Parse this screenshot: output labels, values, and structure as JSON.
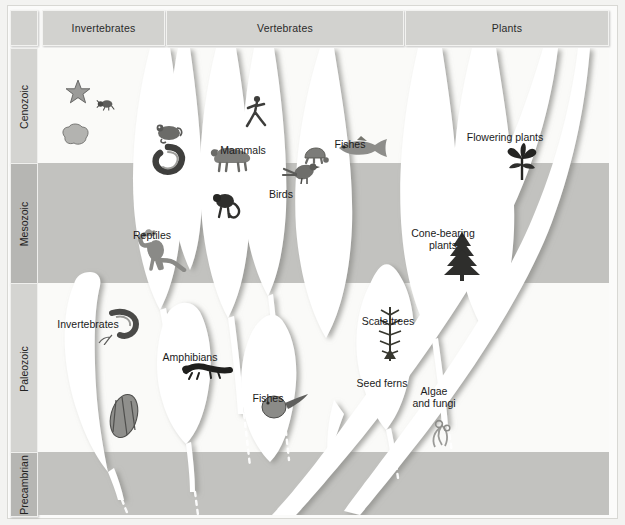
{
  "figure": {
    "kind": "evolutionary-tree-diagram",
    "columns": [
      {
        "id": "invertebrates",
        "label": "Invertebrates",
        "x": 42,
        "width": 121
      },
      {
        "id": "vertebrates",
        "label": "Vertebrates",
        "x": 166,
        "width": 236
      },
      {
        "id": "plants",
        "label": "Plants",
        "x": 405,
        "width": 202
      }
    ],
    "eras": [
      {
        "id": "cenozoic",
        "label": "Cenozoic",
        "top": 48,
        "height": 115,
        "shade": "light"
      },
      {
        "id": "mesozoic",
        "label": "Mesozoic",
        "top": 163,
        "height": 120,
        "shade": "dark"
      },
      {
        "id": "paleozoic",
        "label": "Paleozoic",
        "top": 283,
        "height": 169,
        "shade": "light"
      },
      {
        "id": "precambrian",
        "label": "Precambrian",
        "top": 452,
        "height": 63,
        "shade": "dark"
      }
    ],
    "groups": [
      {
        "id": "invertebrates-upper",
        "label": "Invertebrates",
        "x": 88,
        "y": 277,
        "lines": 1,
        "organism": "trilobite"
      },
      {
        "id": "reptiles",
        "label": "Reptiles",
        "x": 152,
        "y": 188,
        "lines": 1,
        "organism": "dinosaur"
      },
      {
        "id": "amphibians",
        "label": "Amphibians",
        "x": 190,
        "y": 310,
        "lines": 1,
        "organism": "salamander"
      },
      {
        "id": "mammals",
        "label": "Mammals",
        "x": 243,
        "y": 103,
        "lines": 1,
        "organism": "buffalo"
      },
      {
        "id": "birds",
        "label": "Birds",
        "x": 281,
        "y": 147,
        "lines": 1,
        "organism": "bird"
      },
      {
        "id": "fishes-lower",
        "label": "Fishes",
        "x": 268,
        "y": 351,
        "lines": 1,
        "organism": "jawless-fish"
      },
      {
        "id": "fishes-upper",
        "label": "Fishes",
        "x": 350,
        "y": 97,
        "lines": 1,
        "organism": "trout"
      },
      {
        "id": "scale-trees",
        "label": "Scale trees",
        "x": 388,
        "y": 274,
        "lines": 1,
        "organism": "lycopod"
      },
      {
        "id": "seed-ferns",
        "label": "Seed ferns",
        "x": 382,
        "y": 342,
        "lines": 2,
        "organism": ""
      },
      {
        "id": "algae-and-fungi",
        "label": "Algae and fungi",
        "x": 434,
        "y": 350,
        "lines": 3,
        "organism": "algae"
      },
      {
        "id": "cone-bearing-plants",
        "label": "Cone-bearing plants",
        "x": 443,
        "y": 192,
        "lines": 2,
        "organism": "conifer"
      },
      {
        "id": "flowering-plants",
        "label": "Flowering plants",
        "x": 505,
        "y": 90,
        "lines": 1,
        "organism": "iris"
      }
    ],
    "extra_organisms": [
      {
        "id": "starfish",
        "x": 78,
        "y": 92
      },
      {
        "id": "insect",
        "x": 106,
        "y": 104
      },
      {
        "id": "sponge",
        "x": 75,
        "y": 134
      },
      {
        "id": "snake",
        "x": 150,
        "y": 130
      },
      {
        "id": "frog",
        "x": 168,
        "y": 97
      },
      {
        "id": "human",
        "x": 232,
        "y": 82
      },
      {
        "id": "monkey",
        "x": 208,
        "y": 174
      },
      {
        "id": "turtle",
        "x": 296,
        "y": 122
      },
      {
        "id": "ammonite",
        "x": 104,
        "y": 296
      }
    ],
    "colors": {
      "page_background": "#f3f3f1",
      "frame": "#fbfbfa",
      "band_light": "#fafaf8",
      "band_dark": "#c2c2bf",
      "header_tab": "#d2d2cf",
      "era_tab": "#d4d4d1",
      "era_tab_active": "#b6b6b3",
      "branch_fill": "#ffffff",
      "branch_shadow": "#9a9a97",
      "text": "#1b1b1b"
    }
  }
}
